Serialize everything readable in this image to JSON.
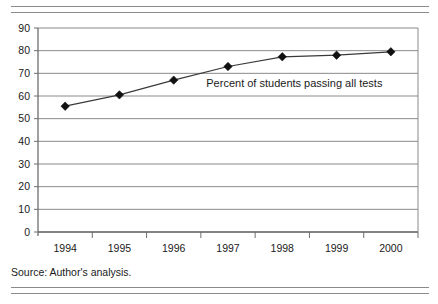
{
  "figure": {
    "source_note": "Source: Author's analysis."
  },
  "chart_data": {
    "type": "line",
    "title": "",
    "subtitle": "",
    "xlabel": "",
    "ylabel": "",
    "categories": [
      "1994",
      "1995",
      "1996",
      "1997",
      "1998",
      "1999",
      "2000"
    ],
    "values": [
      55.5,
      60.5,
      67.0,
      73.0,
      77.3,
      78.0,
      79.5
    ],
    "series": [
      {
        "name": "Percent of students passing all tests",
        "values": [
          55.5,
          60.5,
          67.0,
          73.0,
          77.3,
          78.0,
          79.5
        ]
      }
    ],
    "annotations": [
      {
        "text": "Percent of students passing all tests",
        "x": 1996.6,
        "y": 64
      }
    ],
    "ylim": [
      0,
      90
    ],
    "yticks": [
      0,
      10,
      20,
      30,
      40,
      50,
      60,
      70,
      80,
      90
    ],
    "ytick_labels": [
      "0",
      "10",
      "20",
      "30",
      "40",
      "50",
      "60",
      "70",
      "80",
      "90"
    ],
    "xtick_labels": [
      "1994",
      "1995",
      "1996",
      "1997",
      "1998",
      "1999",
      "2000"
    ],
    "grid": "horizontal",
    "legend": "none",
    "marker": "diamond",
    "colors": {
      "line": "#3a3a3a",
      "marker": "#111111",
      "grid": "#8a8a8a",
      "axis": "#6e6e6e",
      "frame": "#8a8a8a",
      "text": "#1a1a1a",
      "background": "#ffffff"
    }
  }
}
